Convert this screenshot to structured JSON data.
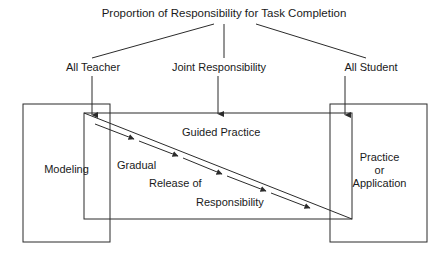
{
  "diagram": {
    "title": "Proportion of Responsibility for Task Completion",
    "stage_labels": {
      "left": "All Teacher",
      "center": "Joint Responsibility",
      "right": "All Student"
    },
    "boxes": {
      "left": "Modeling",
      "center": "Guided Practice",
      "right_line1": "Practice",
      "right_line2": "or",
      "right_line3": "Application"
    },
    "diagonal_caption": {
      "line1": "Gradual",
      "line2": "Release of",
      "line3": "Responsibility"
    },
    "colors": {
      "background": "#ffffff",
      "stroke": "#2b2b2b",
      "text": "#1a1a1a"
    }
  }
}
